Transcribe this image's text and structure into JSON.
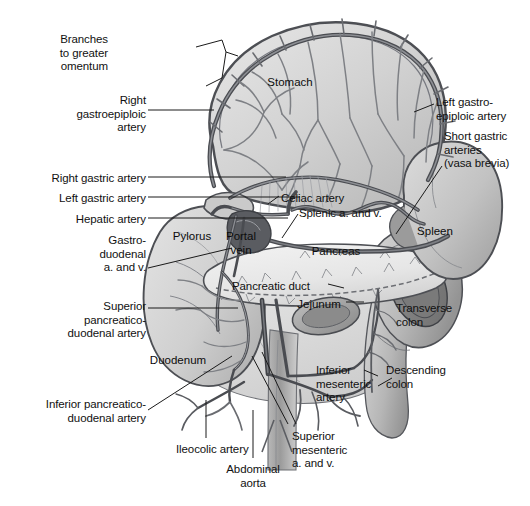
{
  "figure": {
    "background_color": "#ffffff",
    "ink_color": "#111111",
    "vessel_color": "#595b60",
    "organ_fill_light": "#d9d9d9",
    "organ_fill_mid": "#b4b4b4",
    "organ_fill_dark": "#8a8a8a"
  },
  "callout_labels": [
    {
      "id": "branches-to-greater-omentum",
      "text": "Branches\nto greater\nomentum",
      "x": 108,
      "y": 33,
      "align": "right",
      "width": 88
    },
    {
      "id": "right-gastroepiploic-artery",
      "text": "Right\ngastroepiploic\nartery",
      "x": 58,
      "y": 94,
      "align": "right",
      "width": 88
    },
    {
      "id": "right-gastric-artery",
      "text": "Right gastric artery",
      "x": 20,
      "y": 172,
      "align": "right",
      "width": 126
    },
    {
      "id": "left-gastric-artery",
      "text": "Left gastric artery",
      "x": 26,
      "y": 192,
      "align": "right",
      "width": 120
    },
    {
      "id": "hepatic-artery",
      "text": "Hepatic artery",
      "x": 50,
      "y": 213,
      "align": "right",
      "width": 96
    },
    {
      "id": "gastroduodenal-a-and-v",
      "text": "Gastro-\nduodenal\na. and v.",
      "x": 78,
      "y": 234,
      "align": "right",
      "width": 68
    },
    {
      "id": "superior-pancreaticoduodenal-artery",
      "text": "Superior\npancreatico-\nduodenal artery",
      "x": 38,
      "y": 300,
      "align": "right",
      "width": 108
    },
    {
      "id": "inferior-pancreaticoduodenal-artery",
      "text": "Inferior pancreatico-\nduodenal artery",
      "x": 20,
      "y": 398,
      "align": "right",
      "width": 126
    },
    {
      "id": "ileocolic-artery",
      "text": "Ileocolic artery",
      "x": 176,
      "y": 443,
      "align": "left",
      "width": 92
    },
    {
      "id": "abdominal-aorta",
      "text": "Abdominal\naorta",
      "x": 214,
      "y": 463,
      "align": "center",
      "width": 78
    },
    {
      "id": "superior-mesenteric-a-and-v",
      "text": "Superior\nmesenteric\na. and v.",
      "x": 292,
      "y": 430,
      "align": "left",
      "width": 80
    },
    {
      "id": "inferior-mesenteric-artery",
      "text": "Inferior\nmesenteric\nartery",
      "x": 316,
      "y": 364,
      "align": "left",
      "width": 74
    },
    {
      "id": "descending-colon",
      "text": "Descending\ncolon",
      "x": 386,
      "y": 364,
      "align": "left",
      "width": 72
    },
    {
      "id": "transverse-colon",
      "text": "Transverse\ncolon",
      "x": 396,
      "y": 302,
      "align": "left",
      "width": 70
    },
    {
      "id": "left-gastroepiploic-artery",
      "text": "Left gastro-\nepiploic artery",
      "x": 436,
      "y": 96,
      "align": "left",
      "width": 90
    },
    {
      "id": "short-gastric-arteries-vasa-brevia",
      "text": "Short gastric\narteries\n(vasa brevia)",
      "x": 444,
      "y": 130,
      "align": "left",
      "width": 86
    },
    {
      "id": "celiac-artery",
      "text": "Celiac artery",
      "x": 281,
      "y": 192,
      "align": "left",
      "width": 78
    },
    {
      "id": "splenic-a-and-v",
      "text": "Splenic a. and v.",
      "x": 299,
      "y": 207,
      "align": "left",
      "width": 100
    },
    {
      "id": "pancreatic-duct",
      "text": "Pancreatic duct",
      "x": 232,
      "y": 280,
      "align": "left",
      "width": 94
    }
  ],
  "organ_labels": [
    {
      "id": "stomach",
      "text": "Stomach",
      "x": 290,
      "y": 76
    },
    {
      "id": "spleen",
      "text": "Spleen",
      "x": 435,
      "y": 225
    },
    {
      "id": "pylorus",
      "text": "Pylorus",
      "x": 192,
      "y": 230
    },
    {
      "id": "portal-vein",
      "text": "Portal\nvein",
      "x": 237,
      "y": 230
    },
    {
      "id": "pancreas",
      "text": "Pancreas",
      "x": 336,
      "y": 245
    },
    {
      "id": "jejunum",
      "text": "Jejunum",
      "x": 319,
      "y": 298
    },
    {
      "id": "duodenum",
      "text": "Duodenum",
      "x": 178,
      "y": 354
    }
  ]
}
